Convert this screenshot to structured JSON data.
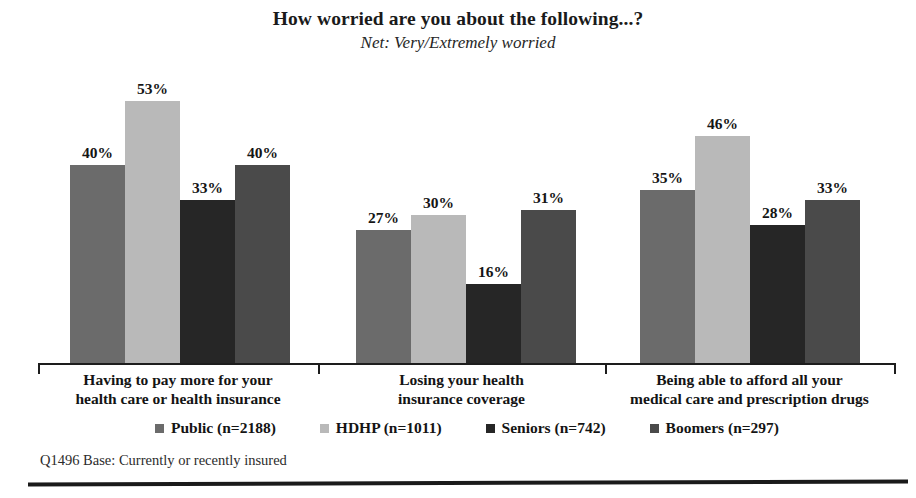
{
  "chart_data": {
    "type": "bar",
    "title": "How worried are you about the following...?",
    "subtitle": "Net: Very/Extremely worried",
    "xlabel": "",
    "ylabel": "",
    "ylim": [
      0,
      60
    ],
    "grid": false,
    "legend_position": "bottom",
    "value_suffix": "%",
    "categories": [
      "Having to pay more for your\nhealth care or health insurance",
      "Losing your health\ninsurance coverage",
      "Being able to afford all your\nmedical care and prescription drugs"
    ],
    "category_lines": [
      [
        "Having to pay more for your",
        "health care or health insurance"
      ],
      [
        "Losing your health",
        "insurance coverage"
      ],
      [
        "Being able to afford all your",
        "medical care and prescription drugs"
      ]
    ],
    "series": [
      {
        "name": "Public (n=2188)",
        "color": "#6b6b6b",
        "values": [
          40,
          27,
          35
        ],
        "labels": [
          "40%",
          "27%",
          "35%"
        ]
      },
      {
        "name": "HDHP (n=1011)",
        "color": "#b9b9b9",
        "values": [
          53,
          30,
          46
        ],
        "labels": [
          "53%",
          "30%",
          "46%"
        ]
      },
      {
        "name": "Seniors (n=742)",
        "color": "#262626",
        "values": [
          33,
          16,
          28
        ],
        "labels": [
          "33%",
          "16%",
          "28%"
        ]
      },
      {
        "name": "Boomers (n=297)",
        "color": "#4a4a4a",
        "values": [
          40,
          31,
          33
        ],
        "labels": [
          "40%",
          "31%",
          "33%"
        ]
      }
    ]
  },
  "footnote": "Q1496 Base: Currently or recently insured"
}
